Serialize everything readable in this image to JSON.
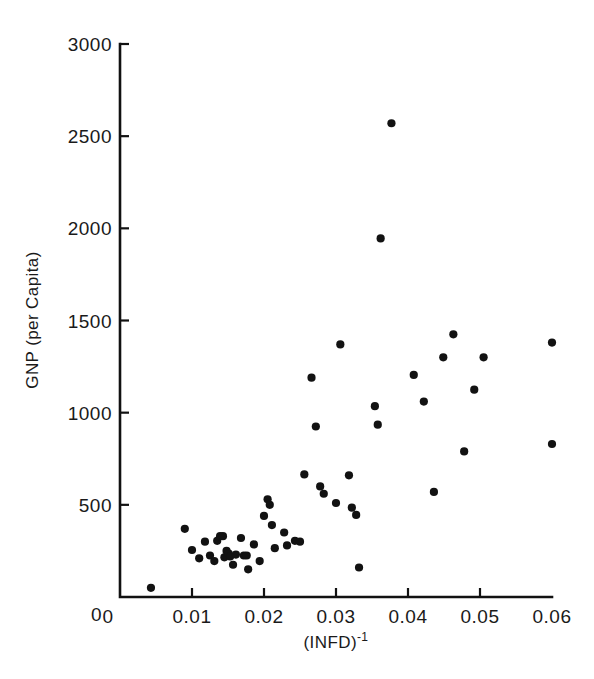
{
  "chart_data": {
    "type": "scatter",
    "title": "",
    "xlabel": "(INFD)-1",
    "xlabel_base": "(INFD)",
    "xlabel_exponent": "-1",
    "ylabel": "GNP (per Capita)",
    "xlim": [
      0,
      0.06
    ],
    "ylim": [
      0,
      3000
    ],
    "xticks": [
      0,
      0.01,
      0.02,
      0.03,
      0.04,
      0.05,
      0.06
    ],
    "xticklabels": [
      "0",
      "0.01",
      "0.02",
      "0.03",
      "0.04",
      "0.05",
      "0.06"
    ],
    "yticks": [
      0,
      500,
      1000,
      1500,
      2000,
      2500,
      3000
    ],
    "yticklabels": [
      "0",
      "500",
      "1000",
      "1500",
      "2000",
      "2500",
      "3000"
    ],
    "grid": false,
    "legend": null,
    "marker_color": "#121212",
    "marker_size": 5,
    "n_points": 52,
    "points": [
      [
        0.0043,
        50
      ],
      [
        0.009,
        370
      ],
      [
        0.01,
        255
      ],
      [
        0.011,
        210
      ],
      [
        0.0118,
        300
      ],
      [
        0.0125,
        225
      ],
      [
        0.0131,
        195
      ],
      [
        0.0135,
        305
      ],
      [
        0.0139,
        330
      ],
      [
        0.0143,
        330
      ],
      [
        0.0145,
        215
      ],
      [
        0.0148,
        250
      ],
      [
        0.0151,
        235
      ],
      [
        0.0153,
        220
      ],
      [
        0.0157,
        175
      ],
      [
        0.0161,
        230
      ],
      [
        0.0168,
        320
      ],
      [
        0.0172,
        225
      ],
      [
        0.0176,
        225
      ],
      [
        0.0178,
        150
      ],
      [
        0.0186,
        285
      ],
      [
        0.0194,
        195
      ],
      [
        0.02,
        440
      ],
      [
        0.0205,
        530
      ],
      [
        0.0208,
        500
      ],
      [
        0.0211,
        390
      ],
      [
        0.0215,
        265
      ],
      [
        0.0228,
        350
      ],
      [
        0.0232,
        280
      ],
      [
        0.0243,
        305
      ],
      [
        0.025,
        300
      ],
      [
        0.0256,
        665
      ],
      [
        0.0266,
        1190
      ],
      [
        0.0272,
        925
      ],
      [
        0.0278,
        600
      ],
      [
        0.0283,
        560
      ],
      [
        0.03,
        510
      ],
      [
        0.0306,
        1370
      ],
      [
        0.0318,
        660
      ],
      [
        0.0322,
        485
      ],
      [
        0.0328,
        445
      ],
      [
        0.0332,
        160
      ],
      [
        0.0354,
        1035
      ],
      [
        0.0358,
        935
      ],
      [
        0.0362,
        1945
      ],
      [
        0.0377,
        2570
      ],
      [
        0.0408,
        1205
      ],
      [
        0.0422,
        1060
      ],
      [
        0.0436,
        570
      ],
      [
        0.0449,
        1300
      ],
      [
        0.0463,
        1425
      ],
      [
        0.0478,
        790
      ],
      [
        0.0492,
        1125
      ],
      [
        0.0505,
        1300
      ],
      [
        0.06,
        1380
      ],
      [
        0.06,
        830
      ]
    ]
  },
  "axes": {
    "x_axis_name": "x-axis",
    "y_axis_name": "y-axis"
  }
}
